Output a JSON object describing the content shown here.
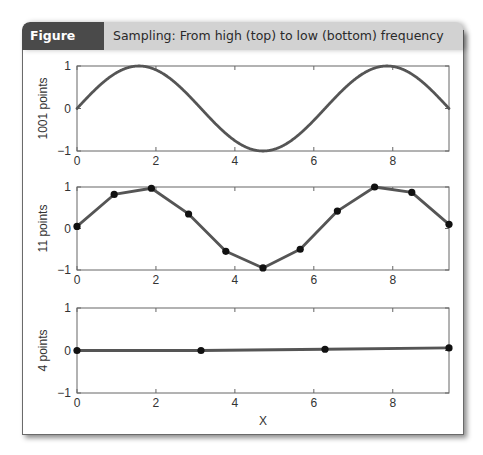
{
  "header": {
    "figure_label": "Figure 5.15",
    "caption": "Sampling: From high (top) to low (bottom) frequency"
  },
  "colors": {
    "header_label_bg": "#4a4a4a",
    "header_caption_bg": "#d2d2d2",
    "line": "#555555",
    "marker": "#111111",
    "axis": "#666666"
  },
  "chart_data": [
    {
      "type": "line",
      "title": "",
      "ylabel": "1001 points",
      "xlabel": "",
      "function": "sin(x)",
      "n_points": 1001,
      "markers": false,
      "xlim": [
        0,
        9.4248
      ],
      "ylim": [
        -1,
        1
      ],
      "xticks": [
        0,
        2,
        4,
        6,
        8
      ],
      "yticks": [
        -1,
        0,
        1
      ],
      "grid": false
    },
    {
      "type": "line",
      "title": "",
      "ylabel": "11 points",
      "xlabel": "",
      "markers": true,
      "x": [
        0,
        0.942,
        1.885,
        2.827,
        3.77,
        4.712,
        5.655,
        6.597,
        7.54,
        8.482,
        9.425
      ],
      "y": [
        0.05,
        0.82,
        0.97,
        0.35,
        -0.55,
        -0.95,
        -0.5,
        0.42,
        1.0,
        0.87,
        0.1
      ],
      "xlim": [
        0,
        9.4248
      ],
      "ylim": [
        -1,
        1
      ],
      "xticks": [
        0,
        2,
        4,
        6,
        8
      ],
      "yticks": [
        -1,
        0,
        1
      ],
      "grid": false
    },
    {
      "type": "line",
      "title": "",
      "ylabel": "4 points",
      "xlabel": "X",
      "markers": true,
      "x": [
        0,
        3.1416,
        6.2832,
        9.4248
      ],
      "y": [
        0.0,
        0.0,
        0.03,
        0.06
      ],
      "xlim": [
        0,
        9.4248
      ],
      "ylim": [
        -1,
        1
      ],
      "xticks": [
        0,
        2,
        4,
        6,
        8
      ],
      "yticks": [
        -1,
        0,
        1
      ],
      "grid": false
    }
  ]
}
